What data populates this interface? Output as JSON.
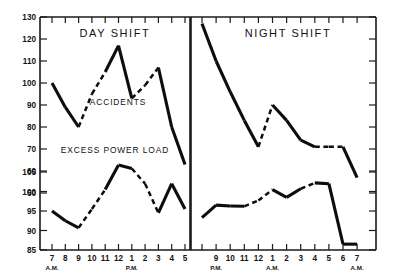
{
  "figure": {
    "background_color": "#ffffff",
    "ink_color": "#0d0d0d",
    "width": 399,
    "height": 273
  },
  "panels": [
    {
      "key": "day",
      "title": "DAY SHIFT"
    },
    {
      "key": "night",
      "title": "NIGHT SHIFT"
    }
  ],
  "series_labels": {
    "accidents": "ACCIDENTS",
    "power": "EXCESS POWER LOAD"
  },
  "axes": {
    "upper_y_ticks": [
      "130",
      "120",
      "110",
      "100",
      "90",
      "80",
      "70",
      "60",
      "50"
    ],
    "lower_y_ticks": [
      "105",
      "100",
      "95",
      "90",
      "85"
    ],
    "day_x_ticks": [
      "7",
      "8",
      "9",
      "10",
      "11",
      "12",
      "1",
      "2",
      "3",
      "4",
      "5"
    ],
    "day_x_period_first": "A.M.",
    "day_x_period_second": "P.M.",
    "night_x_ticks": [
      "9",
      "10",
      "11",
      "12",
      "1",
      "2",
      "3",
      "4",
      "5",
      "6",
      "7"
    ],
    "night_x_period_first": "P.M.",
    "night_x_period_second": "A.M.",
    "night_x_period_last": "A.M."
  },
  "chart_data": {
    "type": "line",
    "xlabel": "",
    "ylabel": "",
    "grid": false,
    "legend_position": "inline-annotation",
    "panels": [
      {
        "name": "DAY SHIFT",
        "x": [
          "7 A.M.",
          "8 A.M.",
          "9 A.M.",
          "10 A.M.",
          "11 A.M.",
          "12",
          "1 P.M.",
          "2 P.M.",
          "3 P.M.",
          "4 P.M.",
          "5 P.M."
        ],
        "series": [
          {
            "name": "ACCIDENTS",
            "ylim": [
              50,
              130
            ],
            "ytick_labels": [
              "130",
              "120",
              "110",
              "100",
              "90",
              "80",
              "70",
              "60",
              "50"
            ],
            "values": [
              100,
              89,
              80,
              95,
              105,
              117,
              93,
              99,
              107,
              80,
              63
            ],
            "segment_styles": [
              "solid",
              "solid",
              "dashed",
              "dashed",
              "solid",
              "solid",
              "dashed",
              "dashed",
              "solid",
              "solid"
            ]
          },
          {
            "name": "EXCESS POWER LOAD",
            "ylim": [
              85,
              110
            ],
            "ytick_labels": [
              "105",
              "100",
              "95",
              "90",
              "85"
            ],
            "values": [
              95,
              92.5,
              90.7,
              95.5,
              100.5,
              106.8,
              105.9,
              102,
              94.5,
              102,
              95.5
            ],
            "segment_styles": [
              "solid",
              "solid",
              "dashed",
              "dashed",
              "solid",
              "solid",
              "dashed",
              "dashed",
              "solid",
              "solid"
            ]
          }
        ]
      },
      {
        "name": "NIGHT SHIFT",
        "x": [
          "8 P.M.",
          "9 P.M.",
          "10 P.M.",
          "11 P.M.",
          "12",
          "1 A.M.",
          "2 A.M.",
          "3 A.M.",
          "4 A.M.",
          "5 A.M.",
          "6 A.M.",
          "7 A.M."
        ],
        "series": [
          {
            "name": "ACCIDENTS",
            "ylim": [
              50,
              130
            ],
            "ytick_labels": [
              "130",
              "120",
              "110",
              "100",
              "90",
              "80",
              "70",
              "60",
              "50"
            ],
            "values": [
              127,
              110,
              96,
              83,
              71,
              90,
              83,
              74,
              71,
              71,
              71,
              57
            ],
            "segment_styles": [
              "solid",
              "solid",
              "solid",
              "solid",
              "dashed",
              "solid",
              "solid",
              "solid",
              "dashed",
              "dashed",
              "solid"
            ]
          },
          {
            "name": "EXCESS POWER LOAD",
            "ylim": [
              85,
              110
            ],
            "ytick_labels": [
              "105",
              "100",
              "95",
              "90",
              "85"
            ],
            "values": [
              93.3,
              96.5,
              96.3,
              96.2,
              97.7,
              100.5,
              98.5,
              100.7,
              102.2,
              102,
              86.5,
              86.5
            ],
            "segment_styles": [
              "solid",
              "solid",
              "solid",
              "dashed",
              "dashed",
              "solid",
              "solid",
              "dashed",
              "solid",
              "solid",
              "solid"
            ]
          }
        ]
      }
    ]
  }
}
